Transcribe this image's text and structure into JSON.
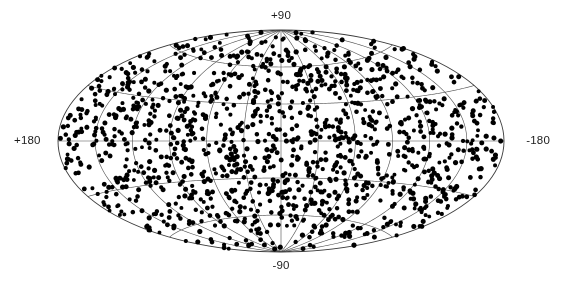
{
  "figure": {
    "kind": "all-sky-scatter-map",
    "projection": "aitoff",
    "background_color": "#ffffff"
  },
  "labels": {
    "top": "+90",
    "bottom": "-90",
    "left": "+180",
    "right": "-180"
  },
  "chart_data": {
    "type": "scatter",
    "title": "",
    "subtitle": "",
    "xlabel": "",
    "ylabel": "",
    "projection": "aitoff",
    "coordinate_system": "longitude-latitude",
    "grid": true,
    "legend": null,
    "annotations": [],
    "tick_labels": {
      "north_pole": "+90",
      "south_pole": "-90",
      "left_limb": "+180",
      "right_limb": "-180"
    },
    "longitude_label_direction": "increasing-to-the-left",
    "xlim": [
      180,
      -180
    ],
    "ylim": [
      -90,
      90
    ],
    "graticule": {
      "meridian_step_deg": 30,
      "parallel_step_deg": 30,
      "meridians_deg": [
        -180,
        -150,
        -120,
        -90,
        -60,
        -30,
        0,
        30,
        60,
        90,
        120,
        150,
        180
      ],
      "parallels_deg": [
        -60,
        -30,
        0,
        30,
        60
      ],
      "line_color": "#4a4a4a",
      "line_width_px": 0.6,
      "boundary_color": "#3a3a3a",
      "boundary_width_px": 0.9
    },
    "markers": {
      "shape": "circle",
      "color": "#000000",
      "size_px": 4.4,
      "edge": "none"
    },
    "point_count": 1320,
    "distribution": "isotropic-uniform-on-sphere",
    "random_seed": 20240517,
    "series": [
      {
        "name": "sources",
        "color": "#000000",
        "marker": "circle",
        "n_points": 1320,
        "description": "uniformly distributed points over the celestial sphere"
      }
    ],
    "ellipse_geometry": {
      "center_x_px": 281,
      "center_y_px": 141,
      "semi_major_px": 223,
      "semi_minor_px": 111
    }
  }
}
